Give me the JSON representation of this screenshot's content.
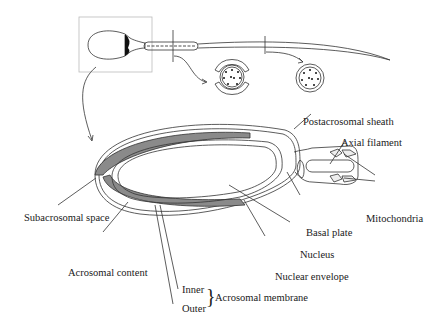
{
  "labels": {
    "postacrosomal_sheath": "Postacrosomal sheath",
    "axial_filament": "Axial filament",
    "mitochondria": "Mitochondria",
    "subacrosomal_space": "Subacrosomal space",
    "basal_plate": "Basal plate",
    "nucleus": "Nucleus",
    "acrosomal_content": "Acrosomal content",
    "nuclear_envelope": "Nuclear envelope",
    "inner": "Inner",
    "outer": "Outer",
    "acrosomal_membrane": "Acrosomal membrane"
  },
  "colors": {
    "line": "#333333",
    "acrosome_fill": "#8a8a8a",
    "box": "#bbbbbb"
  }
}
